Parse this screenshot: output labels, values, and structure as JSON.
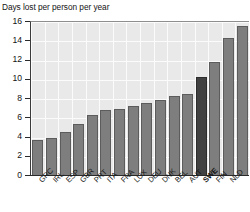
{
  "figure": {
    "supertitle": "Sickness absence from work",
    "axis_title": "Days lost per person per year"
  },
  "chart_data": {
    "type": "bar",
    "title": "Days lost per person per year",
    "xlabel": "",
    "ylabel": "Days lost per person per year",
    "ylim": [
      0,
      16
    ],
    "yticks": [
      0,
      2,
      4,
      6,
      8,
      10,
      12,
      14,
      16
    ],
    "ytick_labels": [
      "0",
      "2",
      "4",
      "6",
      "8",
      "10",
      "12",
      "14",
      "16"
    ],
    "grid": true,
    "legend": "none",
    "highlight_category": "SWE",
    "categories": [
      "GRC",
      "IRL",
      "ESP",
      "GBR",
      "PRT",
      "ITA",
      "FRA",
      "LUX",
      "DEU",
      "DNK",
      "BEL",
      "AUT",
      "SWE",
      "FIN",
      "NLD",
      ""
    ],
    "values": [
      3.7,
      4.0,
      4.6,
      5.4,
      6.3,
      6.9,
      7.0,
      7.3,
      7.6,
      7.9,
      8.3,
      8.5,
      10.3,
      11.8,
      14.3,
      15.6
    ],
    "colors": {
      "bar": "#7e7e7e",
      "bar_edge": "#5c5c5c",
      "bar_highlight": "#414141",
      "plot_background": "#e9e9e9",
      "gridline": "#fbfbfb",
      "axis": "#2a2a2a",
      "text": "#141414"
    }
  }
}
